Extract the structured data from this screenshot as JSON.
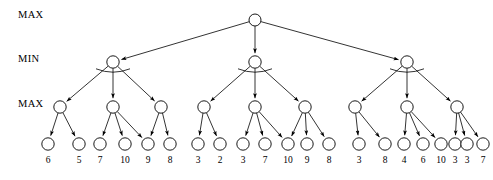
{
  "figure": {
    "row_labels": [
      {
        "text": "MAX",
        "y": 18
      },
      {
        "text": "MIN",
        "y": 62
      },
      {
        "text": "MAX",
        "y": 107
      }
    ],
    "geometry": {
      "root": {
        "x": 255,
        "y": 20,
        "r": 6
      },
      "min_y": 62,
      "max_y": 107,
      "leaf_y": 144,
      "leaf_label_y": 163,
      "node_radius": 6.2,
      "leaf_radius": 6.2
    },
    "root_node": {
      "label": "",
      "x": 255
    },
    "min_nodes": [
      {
        "x": 113
      },
      {
        "x": 255
      },
      {
        "x": 407
      }
    ],
    "max_nodes": [
      {
        "x": 60
      },
      {
        "x": 113
      },
      {
        "x": 161
      },
      {
        "x": 204
      },
      {
        "x": 255
      },
      {
        "x": 305
      },
      {
        "x": 355
      },
      {
        "x": 407
      },
      {
        "x": 457
      }
    ],
    "leaves": [
      {
        "x": 48,
        "value": "6"
      },
      {
        "x": 79,
        "value": "5"
      },
      {
        "x": 100,
        "value": "7"
      },
      {
        "x": 125,
        "value": "10"
      },
      {
        "x": 148,
        "value": "9"
      },
      {
        "x": 170,
        "value": "8"
      },
      {
        "x": 198,
        "value": "3"
      },
      {
        "x": 220,
        "value": "2"
      },
      {
        "x": 243,
        "value": "3"
      },
      {
        "x": 265,
        "value": "7"
      },
      {
        "x": 288,
        "value": "10"
      },
      {
        "x": 307,
        "value": "9"
      },
      {
        "x": 329,
        "value": "8"
      },
      {
        "x": 359,
        "value": "3"
      },
      {
        "x": 385,
        "value": "8"
      },
      {
        "x": 404,
        "value": "4"
      },
      {
        "x": 423,
        "value": "6"
      },
      {
        "x": 441,
        "value": "10"
      },
      {
        "x": 455,
        "value": "3"
      },
      {
        "x": 467,
        "value": "3"
      },
      {
        "x": 483,
        "value": "7"
      }
    ],
    "edges_root_to_min": [
      {
        "from_x": 255,
        "to_x": 113
      },
      {
        "from_x": 255,
        "to_x": 255
      },
      {
        "from_x": 255,
        "to_x": 407
      }
    ],
    "edges_min_to_max": [
      {
        "from_x": 113,
        "to_x": 60
      },
      {
        "from_x": 113,
        "to_x": 113
      },
      {
        "from_x": 113,
        "to_x": 161
      },
      {
        "from_x": 255,
        "to_x": 204
      },
      {
        "from_x": 255,
        "to_x": 255
      },
      {
        "from_x": 255,
        "to_x": 305
      },
      {
        "from_x": 407,
        "to_x": 355
      },
      {
        "from_x": 407,
        "to_x": 407
      },
      {
        "from_x": 407,
        "to_x": 457
      }
    ],
    "edges_max_to_leaf": [
      {
        "from_x": 60,
        "to_x": 48
      },
      {
        "from_x": 60,
        "to_x": 79
      },
      {
        "from_x": 113,
        "to_x": 100
      },
      {
        "from_x": 113,
        "to_x": 125
      },
      {
        "from_x": 113,
        "to_x": 148
      },
      {
        "from_x": 161,
        "to_x": 148
      },
      {
        "from_x": 161,
        "to_x": 170
      },
      {
        "from_x": 204,
        "to_x": 198
      },
      {
        "from_x": 204,
        "to_x": 220
      },
      {
        "from_x": 255,
        "to_x": 243
      },
      {
        "from_x": 255,
        "to_x": 265
      },
      {
        "from_x": 255,
        "to_x": 288
      },
      {
        "from_x": 305,
        "to_x": 288
      },
      {
        "from_x": 305,
        "to_x": 307
      },
      {
        "from_x": 305,
        "to_x": 329
      },
      {
        "from_x": 355,
        "to_x": 359
      },
      {
        "from_x": 355,
        "to_x": 385
      },
      {
        "from_x": 407,
        "to_x": 404
      },
      {
        "from_x": 407,
        "to_x": 423
      },
      {
        "from_x": 407,
        "to_x": 441
      },
      {
        "from_x": 457,
        "to_x": 455
      },
      {
        "from_x": 457,
        "to_x": 467
      },
      {
        "from_x": 457,
        "to_x": 483
      }
    ],
    "fan_arcs": [
      {
        "cx": 113,
        "cy": 62,
        "rx": 17,
        "ry": 10
      },
      {
        "cx": 255,
        "cy": 62,
        "rx": 17,
        "ry": 10
      },
      {
        "cx": 407,
        "cy": 62,
        "rx": 17,
        "ry": 10
      }
    ]
  }
}
